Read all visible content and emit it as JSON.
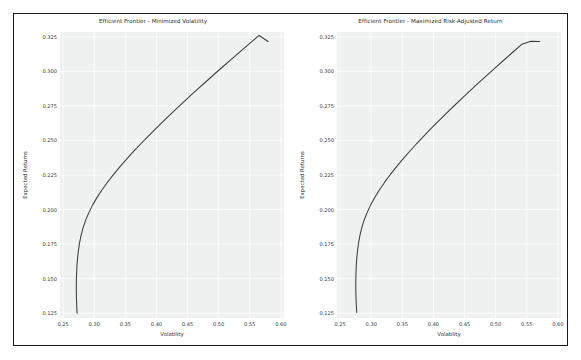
{
  "figure": {
    "background": "#ffffff",
    "border_color": "#1a1a1a",
    "plot_background": "#eff0f0",
    "line_color": "#3c3c3c",
    "grid_color": "#ffffff"
  },
  "chart_data": [
    {
      "type": "line",
      "title": "Efficient Frontier - Minimized Volatility",
      "xlabel": "Volatility",
      "ylabel": "Expected Returns",
      "xlim": [
        0.245,
        0.605
      ],
      "ylim": [
        0.1215,
        0.3285
      ],
      "xticks": [
        0.25,
        0.3,
        0.35,
        0.4,
        0.45,
        0.5,
        0.55,
        0.6
      ],
      "xtick_labels": [
        "0.25",
        "0.30",
        "0.35",
        "0.40",
        "0.45",
        "0.50",
        "0.55",
        "0.60"
      ],
      "yticks": [
        0.125,
        0.15,
        0.175,
        0.2,
        0.225,
        0.25,
        0.275,
        0.3,
        0.325
      ],
      "ytick_labels": [
        "0.125",
        "0.150",
        "0.175",
        "0.200",
        "0.225",
        "0.250",
        "0.275",
        "0.300",
        "0.325"
      ],
      "grid": true,
      "legend": "none",
      "series": [
        {
          "name": "Efficient Frontier",
          "x": [
            0.2725,
            0.2718,
            0.2714,
            0.2712,
            0.2713,
            0.2716,
            0.2722,
            0.2731,
            0.2744,
            0.2762,
            0.2786,
            0.2818,
            0.286,
            0.2912,
            0.2974,
            0.3046,
            0.3127,
            0.3216,
            0.3312,
            0.3415,
            0.3523,
            0.3636,
            0.3753,
            0.3874,
            0.3998,
            0.4125,
            0.4255,
            0.4387,
            0.4521,
            0.4657,
            0.4795,
            0.4934,
            0.5075,
            0.5217,
            0.536,
            0.5504,
            0.5649,
            0.5795
          ],
          "y": [
            0.125,
            0.1306,
            0.1362,
            0.1418,
            0.1473,
            0.1529,
            0.1585,
            0.1641,
            0.1697,
            0.1753,
            0.1808,
            0.1864,
            0.192,
            0.1976,
            0.2032,
            0.2088,
            0.2143,
            0.2199,
            0.2255,
            0.2311,
            0.2367,
            0.2423,
            0.2478,
            0.2534,
            0.259,
            0.2646,
            0.2702,
            0.2758,
            0.2813,
            0.2869,
            0.2925,
            0.2981,
            0.3037,
            0.3093,
            0.3148,
            0.3204,
            0.326,
            0.3216
          ]
        }
      ]
    },
    {
      "type": "line",
      "title": "Efficient Frontier - Maximized Risk-Adjusted Return",
      "xlabel": "Volatility",
      "ylabel": "Expected Returns",
      "xlim": [
        0.245,
        0.605
      ],
      "ylim": [
        0.1215,
        0.3285
      ],
      "xticks": [
        0.25,
        0.3,
        0.35,
        0.4,
        0.45,
        0.5,
        0.55,
        0.6
      ],
      "xtick_labels": [
        "0.25",
        "0.30",
        "0.35",
        "0.40",
        "0.45",
        "0.50",
        "0.55",
        "0.60"
      ],
      "yticks": [
        0.125,
        0.15,
        0.175,
        0.2,
        0.225,
        0.25,
        0.275,
        0.3,
        0.325
      ],
      "ytick_labels": [
        "0.125",
        "0.150",
        "0.175",
        "0.200",
        "0.225",
        "0.250",
        "0.275",
        "0.300",
        "0.325"
      ],
      "grid": true,
      "legend": "none",
      "series": [
        {
          "name": "Efficient Frontier",
          "x": [
            0.2768,
            0.276,
            0.2755,
            0.2752,
            0.2752,
            0.2754,
            0.2759,
            0.2767,
            0.2779,
            0.2795,
            0.2817,
            0.2846,
            0.2884,
            0.2932,
            0.299,
            0.3057,
            0.3133,
            0.3217,
            0.3308,
            0.3405,
            0.3508,
            0.3616,
            0.3728,
            0.3844,
            0.3963,
            0.4085,
            0.421,
            0.4338,
            0.4467,
            0.4599,
            0.4733,
            0.4868,
            0.5005,
            0.5143,
            0.5283,
            0.5423,
            0.5565,
            0.5708
          ],
          "y": [
            0.1255,
            0.131,
            0.1366,
            0.1421,
            0.1477,
            0.1532,
            0.1588,
            0.1643,
            0.1699,
            0.1754,
            0.181,
            0.1865,
            0.1921,
            0.1976,
            0.2032,
            0.2087,
            0.2143,
            0.2198,
            0.2254,
            0.2309,
            0.2365,
            0.242,
            0.2476,
            0.2531,
            0.2587,
            0.2642,
            0.2698,
            0.2753,
            0.2809,
            0.2864,
            0.292,
            0.2975,
            0.3031,
            0.3086,
            0.3142,
            0.3197,
            0.3218,
            0.3216
          ]
        }
      ]
    }
  ]
}
